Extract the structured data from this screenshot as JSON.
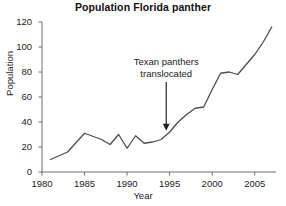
{
  "chart_data": {
    "type": "line",
    "title": "Population Florida panther",
    "xlabel": "Year",
    "ylabel": "Population",
    "xlim": [
      1980,
      2007.5
    ],
    "ylim": [
      0,
      120
    ],
    "grid": false,
    "legend": null,
    "xticks": [
      1980,
      1985,
      1990,
      1995,
      2000,
      2005
    ],
    "xtick_labels": [
      "1980",
      "1985",
      "1990",
      "1995",
      "2000",
      "2005"
    ],
    "yticks": [
      0,
      20,
      40,
      60,
      80,
      100,
      120
    ],
    "ytick_labels": [
      "0",
      "20",
      "40",
      "60",
      "80",
      "100",
      "120"
    ],
    "x": [
      1981,
      1983,
      1985,
      1987,
      1988,
      1989,
      1990,
      1991,
      1992,
      1993,
      1994,
      1995,
      1996,
      1997,
      1998,
      1999,
      2000,
      2001,
      2002,
      2003,
      2004,
      2005,
      2006,
      2007
    ],
    "values": [
      10,
      16,
      31,
      26,
      22,
      30,
      19,
      29,
      23,
      24,
      26,
      32,
      40,
      46,
      51,
      52,
      66,
      79,
      80,
      78,
      86,
      94,
      104,
      116
    ],
    "series": [
      {
        "name": "Florida panther population",
        "color": "#4d4d4d",
        "values": [
          10,
          16,
          31,
          26,
          22,
          30,
          19,
          29,
          23,
          24,
          26,
          32,
          40,
          46,
          51,
          52,
          66,
          79,
          80,
          78,
          86,
          94,
          104,
          116
        ]
      }
    ],
    "annotations": [
      {
        "text_line1": "Texan panthers",
        "text_line2": "translocated",
        "arrow_x": 1994.6,
        "arrow_y_from": 72,
        "arrow_y_to": 33
      }
    ]
  },
  "colors": {
    "line": "#4d4d4d",
    "axis": "#6e6e6e",
    "text": "#222222",
    "title": "#111111",
    "background": "#ffffff"
  }
}
